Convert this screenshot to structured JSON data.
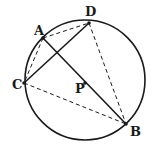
{
  "diagram": {
    "type": "geometry",
    "circle": {
      "cx": 85,
      "cy": 80,
      "r": 60,
      "stroke": "#1a1a1a"
    },
    "points": [
      {
        "id": "A",
        "label": "A",
        "x": 43,
        "y": 38,
        "lx": 34,
        "ly": 35
      },
      {
        "id": "D",
        "label": "D",
        "x": 89,
        "y": 23,
        "lx": 85,
        "ly": 16
      },
      {
        "id": "C",
        "label": "C",
        "x": 24,
        "y": 83,
        "lx": 12,
        "ly": 89
      },
      {
        "id": "B",
        "label": "B",
        "x": 126,
        "y": 124,
        "lx": 130,
        "ly": 136
      },
      {
        "id": "P",
        "label": "P",
        "x": 85,
        "y": 83,
        "lx": 75,
        "ly": 93
      }
    ],
    "solid_segments": [
      [
        "A",
        "B"
      ],
      [
        "C",
        "D"
      ]
    ],
    "dashed_segments": [
      [
        "A",
        "D"
      ],
      [
        "A",
        "C"
      ],
      [
        "C",
        "B"
      ],
      [
        "D",
        "B"
      ]
    ],
    "line_color": "#1a1a1a"
  }
}
